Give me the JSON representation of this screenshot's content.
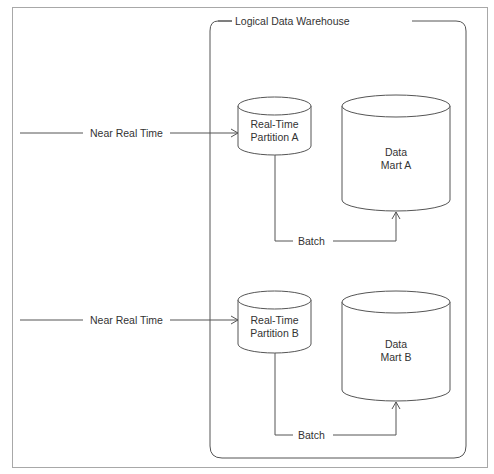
{
  "diagram": {
    "container": {
      "title": "Logical Data Warehouse"
    },
    "flows": [
      {
        "source_label": "Near Real Time",
        "partition": {
          "line1": "Real-Time",
          "line2": "Partition A"
        },
        "batch_label": "Batch",
        "mart": {
          "line1": "Data",
          "line2": "Mart A"
        }
      },
      {
        "source_label": "Near Real Time",
        "partition": {
          "line1": "Real-Time",
          "line2": "Partition B"
        },
        "batch_label": "Batch",
        "mart": {
          "line1": "Data",
          "line2": "Mart B"
        }
      }
    ],
    "colors": {
      "line": "#555555",
      "text": "#333333",
      "frame": "#a8a8a8",
      "background": "#ffffff"
    }
  }
}
